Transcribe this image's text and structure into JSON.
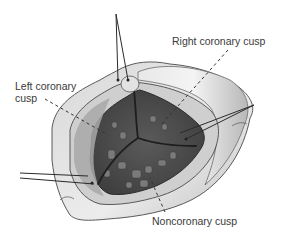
{
  "figure": {
    "labels": {
      "left_coronary_cusp": "Left coronary cusp",
      "right_coronary_cusp": "Right coronary cusp",
      "noncoronary_cusp": "Noncoronary cusp"
    },
    "colors": {
      "background": "#ffffff",
      "aortic_wall_outer": "#c9c9c9",
      "aortic_wall_inner": "#e4e4e4",
      "leaflet_dark": "#4a4a4a",
      "leaflet_mid": "#6a6a6a",
      "commissure_line": "#1e1e1e",
      "suture": "#2a2a2a",
      "leader_line": "#333333",
      "label_text": "#3a3a3a"
    }
  }
}
